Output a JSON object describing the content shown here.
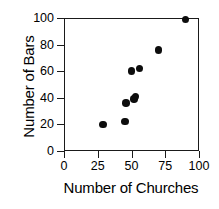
{
  "chart_data": {
    "type": "scatter",
    "title": "",
    "xlabel": "Number of Churches",
    "ylabel": "Number of Bars",
    "xlim": [
      0,
      100
    ],
    "ylim": [
      0,
      100
    ],
    "xticks": [
      0,
      25,
      50,
      75,
      100
    ],
    "yticks": [
      0,
      20,
      40,
      60,
      80,
      100
    ],
    "xtick_labels": [
      "0",
      "25",
      "50",
      "75",
      "100"
    ],
    "ytick_labels": [
      "0",
      "20",
      "40",
      "60",
      "80",
      "100"
    ],
    "grid": false,
    "legend": false,
    "marker": "filled-circle",
    "marker_color": "#0d0d0d",
    "frame_color": "#1a1a1a",
    "background": "#ffffff",
    "n_points": 9,
    "points": [
      {
        "x": 29,
        "y": 20
      },
      {
        "x": 45,
        "y": 22
      },
      {
        "x": 46,
        "y": 36
      },
      {
        "x": 52,
        "y": 39
      },
      {
        "x": 53,
        "y": 41
      },
      {
        "x": 50,
        "y": 60
      },
      {
        "x": 56,
        "y": 62
      },
      {
        "x": 70,
        "y": 76
      },
      {
        "x": 90,
        "y": 99
      }
    ],
    "x": [
      29,
      45,
      46,
      52,
      53,
      50,
      56,
      70,
      90
    ],
    "y": [
      20,
      22,
      36,
      39,
      41,
      60,
      62,
      76,
      99
    ]
  }
}
